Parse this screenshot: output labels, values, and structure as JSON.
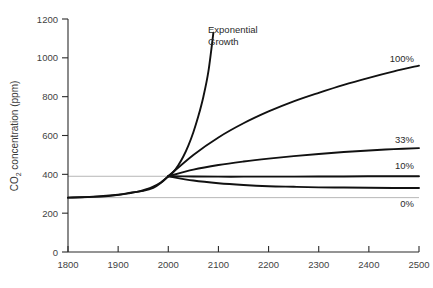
{
  "chart_data": {
    "type": "line",
    "title": "",
    "xlabel": "",
    "ylabel": "CO2 concentration (ppm)",
    "ylabel_prefix": "CO",
    "ylabel_sub": "2",
    "ylabel_suffix": " concentration (ppm)",
    "xlim": [
      1800,
      2500
    ],
    "ylim": [
      0,
      1200
    ],
    "grid": false,
    "legend_position": "inline-right",
    "xticks": [
      1800,
      1900,
      2000,
      2100,
      2200,
      2300,
      2400,
      2500
    ],
    "yticks": [
      0,
      200,
      400,
      600,
      800,
      1000,
      1200
    ],
    "reference_lines": [
      {
        "name": "present-level",
        "value": 390
      },
      {
        "name": "preindustrial-level",
        "value": 280
      }
    ],
    "annotations": [
      {
        "name": "exponential-growth",
        "line1": "Exponential",
        "line2": "Growth",
        "x": 2100,
        "y": 1120
      }
    ],
    "series": [
      {
        "name": "exponential",
        "label": "Exponential Growth",
        "x": [
          1800,
          1850,
          1900,
          1925,
          1950,
          1970,
          1985,
          2000,
          2010,
          2020,
          2030,
          2040,
          2050,
          2060,
          2070,
          2080,
          2090
        ],
        "values": [
          280,
          285,
          295,
          305,
          315,
          330,
          355,
          390,
          412,
          447,
          492,
          548,
          617,
          700,
          800,
          930,
          1130
        ]
      },
      {
        "name": "pct-100",
        "label": "100%",
        "x": [
          2000,
          2050,
          2100,
          2150,
          2200,
          2250,
          2300,
          2350,
          2400,
          2450,
          2500
        ],
        "values": [
          390,
          500,
          590,
          663,
          724,
          776,
          820,
          861,
          897,
          930,
          960
        ]
      },
      {
        "name": "pct-33",
        "label": "33%",
        "x": [
          2000,
          2050,
          2100,
          2150,
          2200,
          2250,
          2300,
          2350,
          2400,
          2450,
          2500
        ],
        "values": [
          390,
          424,
          448,
          466,
          481,
          494,
          505,
          515,
          523,
          530,
          535
        ]
      },
      {
        "name": "pct-10",
        "label": "10%",
        "x": [
          2000,
          2050,
          2100,
          2150,
          2200,
          2250,
          2300,
          2350,
          2400,
          2450,
          2500
        ],
        "values": [
          390,
          389,
          388,
          388,
          388,
          388,
          389,
          389,
          390,
          390,
          390
        ]
      },
      {
        "name": "pct-0",
        "label": "0%",
        "x": [
          2000,
          2050,
          2100,
          2150,
          2200,
          2250,
          2300,
          2350,
          2400,
          2450,
          2500
        ],
        "values": [
          390,
          368,
          354,
          345,
          339,
          336,
          333,
          332,
          331,
          330,
          330
        ]
      },
      {
        "name": "historical",
        "label": "",
        "x": [
          1800,
          1850,
          1880,
          1900,
          1920,
          1940,
          1955,
          1970,
          1985,
          1995,
          2000
        ],
        "values": [
          280,
          284,
          288,
          294,
          302,
          311,
          322,
          337,
          358,
          378,
          390
        ]
      }
    ],
    "series_labels": [
      {
        "name": "label-100",
        "text": "100%"
      },
      {
        "name": "label-33",
        "text": "33%"
      },
      {
        "name": "label-10",
        "text": "10%"
      },
      {
        "name": "label-0",
        "text": "0%"
      }
    ]
  }
}
